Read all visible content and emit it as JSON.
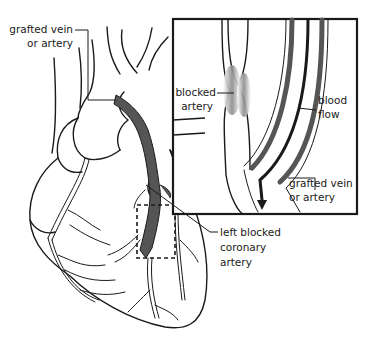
{
  "diagram": {
    "labels": {
      "grafted_vein_top": [
        "grafted vein",
        "or artery"
      ],
      "blocked_artery": [
        "blocked",
        "artery"
      ],
      "blood_flow": [
        "blood",
        "flow"
      ],
      "grafted_vein_inset": [
        "grafted vein",
        "or artery"
      ],
      "left_blocked_coronary": [
        "left blocked",
        "coronary",
        "artery"
      ]
    },
    "colors": {
      "line": "#1a1a1a",
      "graft_fill": "#555555",
      "blockage_shade": "#9a9a9a",
      "background": "#ffffff"
    }
  }
}
